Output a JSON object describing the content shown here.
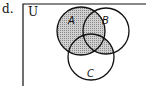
{
  "label": "d.",
  "universe_label": "U",
  "sets": [
    {
      "name": "A",
      "cx": 81,
      "cy": 31,
      "r": 24
    },
    {
      "name": "B",
      "cx": 106,
      "cy": 31,
      "r": 23
    },
    {
      "name": "C",
      "cx": 91,
      "cy": 57,
      "r": 23
    }
  ],
  "shaded_region": "A ∪ (B ∩ C)",
  "colors": {
    "stroke": "#111111",
    "shade": "#b8b8b8",
    "background": "#ffffff"
  }
}
